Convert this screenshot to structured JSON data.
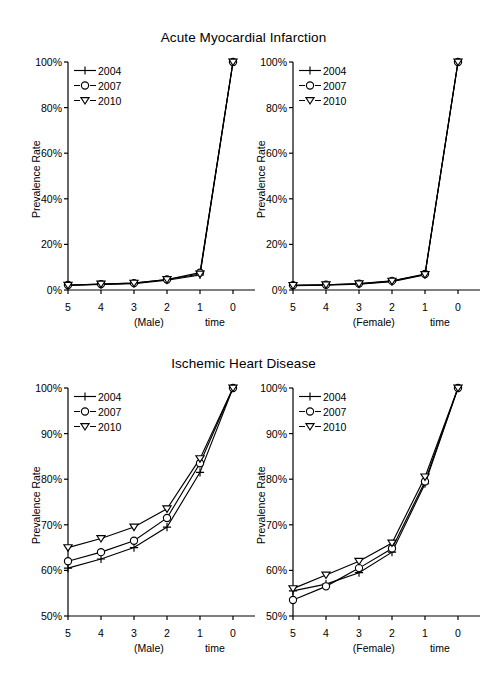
{
  "figure": {
    "titles": [
      {
        "id": "ami",
        "text": "Acute Myocardial Infarction"
      },
      {
        "id": "ihd",
        "text": "Ischemic Heart Disease"
      }
    ],
    "axis_label_y": "Prevalence Rate",
    "axis_label_x": "time",
    "legend_labels": [
      "2004",
      "2007",
      "2010"
    ],
    "markers": {
      "2004": "plus-marker",
      "2007": "circle-marker",
      "2010": "triangle-down-marker"
    },
    "line_color": "#000000",
    "background": "#ffffff"
  },
  "chart_data": [
    {
      "id": "ami-male",
      "type": "line",
      "title": "Acute Myocardial Infarction",
      "panel_label": "(Male)",
      "xlabel": "time",
      "ylabel": "Prevalence Rate",
      "x": [
        5,
        4,
        3,
        2,
        1,
        0
      ],
      "xticklabels": [
        "5",
        "4",
        "3",
        "2",
        "1",
        "0"
      ],
      "yticklabels": [
        "0%",
        "20%",
        "40%",
        "60%",
        "80%",
        "100%"
      ],
      "yticks": [
        0,
        20,
        40,
        60,
        80,
        100
      ],
      "xlim": [
        5,
        0
      ],
      "ylim": [
        0,
        100
      ],
      "grid": false,
      "legend_position": "top-left",
      "series": [
        {
          "name": "2004",
          "marker": "plus-marker",
          "values": [
            2.0,
            2.4,
            2.8,
            4.3,
            6.6,
            100
          ]
        },
        {
          "name": "2007",
          "marker": "circle-marker",
          "values": [
            2.2,
            2.6,
            3.0,
            4.6,
            7.6,
            100
          ]
        },
        {
          "name": "2010",
          "marker": "triangle-down-marker",
          "values": [
            2.1,
            2.6,
            3.0,
            4.6,
            7.0,
            100
          ]
        }
      ]
    },
    {
      "id": "ami-female",
      "type": "line",
      "title": "Acute Myocardial Infarction",
      "panel_label": "(Female)",
      "xlabel": "time",
      "ylabel": "Prevalence Rate",
      "x": [
        5,
        4,
        3,
        2,
        1,
        0
      ],
      "xticklabels": [
        "5",
        "4",
        "3",
        "2",
        "1",
        "0"
      ],
      "yticklabels": [
        "0%",
        "20%",
        "40%",
        "60%",
        "80%",
        "100%"
      ],
      "yticks": [
        0,
        20,
        40,
        60,
        80,
        100
      ],
      "xlim": [
        5,
        0
      ],
      "ylim": [
        0,
        100
      ],
      "grid": false,
      "legend_position": "top-left",
      "series": [
        {
          "name": "2004",
          "marker": "plus-marker",
          "values": [
            1.9,
            2.1,
            2.6,
            3.7,
            6.7,
            100
          ]
        },
        {
          "name": "2007",
          "marker": "circle-marker",
          "values": [
            2.1,
            2.3,
            2.8,
            4.0,
            7.0,
            100
          ]
        },
        {
          "name": "2010",
          "marker": "triangle-down-marker",
          "values": [
            2.0,
            2.3,
            2.7,
            3.9,
            6.8,
            100
          ]
        }
      ]
    },
    {
      "id": "ihd-male",
      "type": "line",
      "title": "Ischemic Heart Disease",
      "panel_label": "(Male)",
      "xlabel": "time",
      "ylabel": "Prevalence Rate",
      "x": [
        5,
        4,
        3,
        2,
        1,
        0
      ],
      "xticklabels": [
        "5",
        "4",
        "3",
        "2",
        "1",
        "0"
      ],
      "yticklabels": [
        "50%",
        "60%",
        "70%",
        "80%",
        "90%",
        "100%"
      ],
      "yticks": [
        50,
        60,
        70,
        80,
        90,
        100
      ],
      "xlim": [
        5,
        0
      ],
      "ylim": [
        50,
        100
      ],
      "grid": false,
      "legend_position": "top-left",
      "series": [
        {
          "name": "2004",
          "marker": "plus-marker",
          "values": [
            60.5,
            62.5,
            65.0,
            69.5,
            81.5,
            100
          ]
        },
        {
          "name": "2007",
          "marker": "circle-marker",
          "values": [
            62.0,
            64.0,
            66.5,
            71.5,
            83.5,
            100
          ]
        },
        {
          "name": "2010",
          "marker": "triangle-down-marker",
          "values": [
            65.0,
            67.0,
            69.5,
            73.5,
            84.5,
            100
          ]
        }
      ]
    },
    {
      "id": "ihd-female",
      "type": "line",
      "title": "Ischemic Heart Disease",
      "panel_label": "(Female)",
      "xlabel": "time",
      "ylabel": "Prevalence Rate",
      "x": [
        5,
        4,
        3,
        2,
        1,
        0
      ],
      "xticklabels": [
        "5",
        "4",
        "3",
        "2",
        "1",
        "0"
      ],
      "yticklabels": [
        "50%",
        "60%",
        "70%",
        "80%",
        "90%",
        "100%"
      ],
      "yticks": [
        50,
        60,
        70,
        80,
        90,
        100
      ],
      "xlim": [
        5,
        0
      ],
      "ylim": [
        50,
        100
      ],
      "grid": false,
      "legend_position": "top-left",
      "series": [
        {
          "name": "2004",
          "marker": "plus-marker",
          "values": [
            55.5,
            57.0,
            59.5,
            64.0,
            79.0,
            100
          ]
        },
        {
          "name": "2007",
          "marker": "circle-marker",
          "values": [
            53.5,
            56.5,
            60.5,
            64.8,
            79.5,
            100
          ]
        },
        {
          "name": "2010",
          "marker": "triangle-down-marker",
          "values": [
            56.0,
            59.0,
            62.0,
            66.0,
            80.5,
            100
          ]
        }
      ]
    }
  ]
}
